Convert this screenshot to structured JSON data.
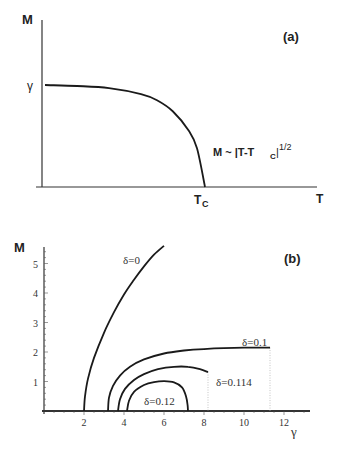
{
  "chart_data": [
    {
      "panel": "(a)",
      "type": "line",
      "title": "",
      "xlabel": "T",
      "ylabel": "M",
      "y_tick_labels": [
        "γ"
      ],
      "x_tick_labels": [
        "T_C"
      ],
      "annotation": "M ~ |T-T_C|^(1/2)",
      "series": [
        {
          "name": "M(T)",
          "description": "Flat at M=γ for low T, then drops to zero at T=T_C with square-root behaviour",
          "x": [
            0,
            0.2,
            0.4,
            0.6,
            0.7,
            0.8,
            0.9,
            0.95,
            1.0
          ],
          "y": [
            1.0,
            0.99,
            0.97,
            0.91,
            0.85,
            0.74,
            0.55,
            0.38,
            0.0
          ]
        }
      ],
      "grid": false
    },
    {
      "panel": "(b)",
      "type": "line",
      "title": "",
      "xlabel": "γ",
      "ylabel": "M",
      "x_ticks": [
        2,
        4,
        6,
        8,
        10,
        12
      ],
      "y_ticks": [
        1,
        2,
        3,
        4,
        5
      ],
      "xlim": [
        0,
        13.2
      ],
      "ylim": [
        0,
        5.6
      ],
      "grid": false,
      "series": [
        {
          "name": "δ=0",
          "x": [
            2.0,
            2.05,
            2.2,
            2.5,
            3.0,
            3.5,
            4.0,
            4.5,
            5.0,
            5.5,
            6.0
          ],
          "y": [
            0.0,
            0.5,
            1.1,
            1.8,
            2.65,
            3.35,
            3.95,
            4.45,
            4.9,
            5.3,
            5.6
          ]
        },
        {
          "name": "δ=0.1",
          "x": [
            3.2,
            3.25,
            3.45,
            3.8,
            4.3,
            5.0,
            6.0,
            7.0,
            8.0,
            9.0,
            10.0,
            11.3
          ],
          "y": [
            0.0,
            0.45,
            0.85,
            1.2,
            1.5,
            1.75,
            1.95,
            2.05,
            2.1,
            2.13,
            2.15,
            2.15
          ]
        },
        {
          "name": "δ=0.114",
          "x": [
            3.7,
            3.8,
            4.05,
            4.5,
            5.0,
            5.7,
            6.5,
            7.2,
            7.8,
            8.2
          ],
          "y": [
            0.0,
            0.4,
            0.75,
            1.05,
            1.25,
            1.42,
            1.5,
            1.5,
            1.42,
            1.32
          ]
        },
        {
          "name": "δ=0.12",
          "x": [
            4.15,
            4.25,
            4.5,
            5.0,
            5.5,
            6.0,
            6.5,
            6.9,
            7.1,
            7.18,
            7.2
          ],
          "y": [
            0.0,
            0.35,
            0.65,
            0.88,
            0.98,
            1.01,
            0.97,
            0.8,
            0.5,
            0.2,
            0.0
          ]
        }
      ],
      "dotted_verticals": [
        {
          "x": 8.2,
          "y_top": 1.32
        },
        {
          "x": 11.3,
          "y_top": 2.15
        }
      ],
      "labels": [
        {
          "text": "δ=0",
          "x": 3.95,
          "y": 5.0
        },
        {
          "text": "δ=0.1",
          "x": 9.9,
          "y": 2.22
        },
        {
          "text": "δ=0.114",
          "x": 8.6,
          "y": 0.85
        },
        {
          "text": "δ=0.12",
          "x": 5.0,
          "y": 0.2
        }
      ]
    }
  ],
  "panel_a": {
    "tag": "(a)",
    "y_axis_label": "M",
    "x_axis_label": "T",
    "gamma_label": "γ",
    "tc_main": "T",
    "tc_sub": "C",
    "annotation_main": "M ~ |T-T",
    "annotation_sub": "C",
    "annotation_tail": "|",
    "annotation_sup": "1/2"
  },
  "panel_b": {
    "tag": "(b)",
    "y_axis_label": "M",
    "x_axis_label": "γ"
  }
}
